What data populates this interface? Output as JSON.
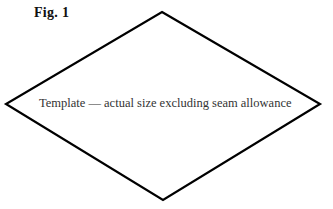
{
  "figure": {
    "label": "Fig. 1",
    "caption": "Template — actual size excluding seam allowance",
    "shape": "diamond",
    "vertices": {
      "top": [
        162,
        12
      ],
      "right": [
        320,
        104
      ],
      "bottom": [
        163,
        200
      ],
      "left": [
        6,
        104
      ]
    },
    "stroke_color": "#000000",
    "stroke_width": 2.2
  }
}
